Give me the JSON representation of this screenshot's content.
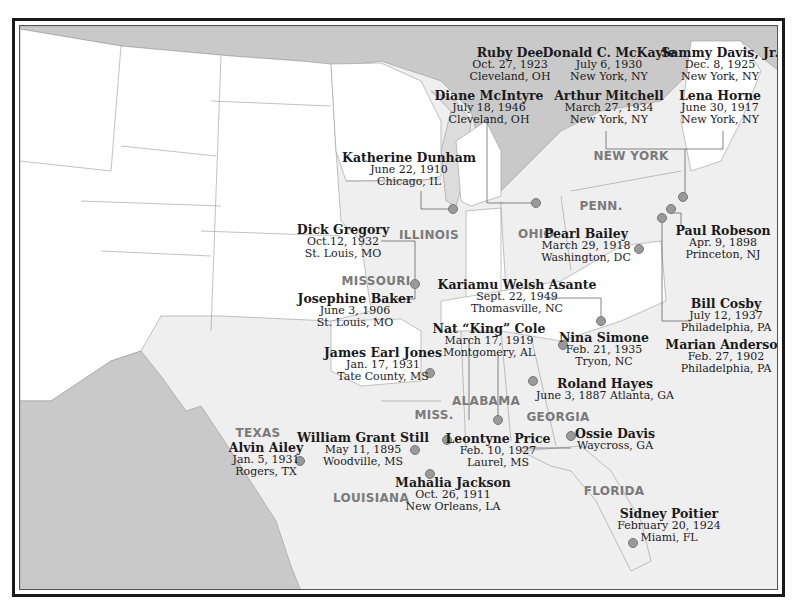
{
  "map": {
    "colors": {
      "land_us": "#efefef",
      "land_other": "#c9c9c9",
      "water": "#c9c9c9",
      "west_states": "#ffffff",
      "highlight_states": "#e6e6e6",
      "border": "#1a1a1a",
      "dot": "#9a9a9a"
    },
    "states": [
      {
        "label": "NEW YORK",
        "x": 630,
        "y": 155
      },
      {
        "label": "PENN.",
        "x": 600,
        "y": 205
      },
      {
        "label": "OHIO",
        "x": 535,
        "y": 233
      },
      {
        "label": "ILLINOIS",
        "x": 428,
        "y": 234
      },
      {
        "label": "MISSOURI",
        "x": 375,
        "y": 280
      },
      {
        "label": "ALABAMA",
        "x": 485,
        "y": 400
      },
      {
        "label": "MISS.",
        "x": 433,
        "y": 414
      },
      {
        "label": "GEORGIA",
        "x": 557,
        "y": 416
      },
      {
        "label": "TEXAS",
        "x": 257,
        "y": 432
      },
      {
        "label": "LOUISIANA",
        "x": 370,
        "y": 497
      },
      {
        "label": "FLORIDA",
        "x": 613,
        "y": 490
      }
    ],
    "people": [
      {
        "name": "Ruby Dee",
        "date": "Oct. 27, 1923",
        "place": "Cleveland, OH",
        "x": 509,
        "y": 52
      },
      {
        "name": "Diane McIntyre",
        "date": "July 18, 1946",
        "place": "Cleveland, OH",
        "x": 488,
        "y": 95
      },
      {
        "name": "Donald C. McKayle",
        "date": "July 6, 1930",
        "place": "New York, NY",
        "x": 608,
        "y": 52
      },
      {
        "name": "Arthur Mitchell",
        "date": "March 27, 1934",
        "place": "New York, NY",
        "x": 608,
        "y": 95
      },
      {
        "name": "Sammy Davis, Jr.",
        "date": "Dec. 8, 1925",
        "place": "New York, NY",
        "x": 719,
        "y": 52
      },
      {
        "name": "Lena Horne",
        "date": "June 30, 1917",
        "place": "New York, NY",
        "x": 719,
        "y": 95
      },
      {
        "name": "Katherine Dunham",
        "date": "June 22, 1910",
        "place": "Chicago, IL",
        "x": 408,
        "y": 157
      },
      {
        "name": "Dick Gregory",
        "date": "Oct.12, 1932",
        "place": "St. Louis, MO",
        "x": 342,
        "y": 229
      },
      {
        "name": "Josephine Baker",
        "date": "June 3, 1906",
        "place": "St. Louis, MO",
        "x": 354,
        "y": 298
      },
      {
        "name": "Pearl Bailey",
        "date": "March 29, 1918",
        "place": "Washington, DC",
        "x": 585,
        "y": 233
      },
      {
        "name": "Paul Robeson",
        "date": "Apr. 9, 1898",
        "place": "Princeton, NJ",
        "x": 722,
        "y": 230
      },
      {
        "name": "Kariamu Welsh Asante",
        "date": "Sept. 22, 1949",
        "place": "Thomasville, NC",
        "x": 516,
        "y": 284
      },
      {
        "name": "Bill Cosby",
        "date": "July 12, 1937",
        "place": "Philadelphia, PA",
        "x": 725,
        "y": 303
      },
      {
        "name": "Marian Anderson",
        "date": "Feb. 27, 1902",
        "place": "Philadelphia, PA",
        "x": 725,
        "y": 344
      },
      {
        "name": "Nat “King” Cole",
        "date": "March 17, 1919",
        "place": "Montgomery, AL",
        "x": 488,
        "y": 328
      },
      {
        "name": "Nina Simone",
        "date": "Feb. 21, 1935",
        "place": "Tryon, NC",
        "x": 603,
        "y": 337
      },
      {
        "name": "James Earl Jones",
        "date": "Jan. 17, 1931",
        "place": "Tate County, MS",
        "x": 382,
        "y": 352
      },
      {
        "name": "Roland Hayes",
        "date": "June 3, 1887 Atlanta, GA",
        "place": "",
        "x": 604,
        "y": 383
      },
      {
        "name": "William Grant Still",
        "date": "May 11, 1895",
        "place": "Woodville, MS",
        "x": 362,
        "y": 437
      },
      {
        "name": "Leontyne Price",
        "date": "Feb. 10, 1927",
        "place": "Laurel, MS",
        "x": 497,
        "y": 438
      },
      {
        "name": "Ossie Davis",
        "date": "Waycross, GA",
        "place": "",
        "x": 614,
        "y": 433
      },
      {
        "name": "Alvin Ailey",
        "date": "Jan. 5, 1931",
        "place": "Rogers, TX",
        "x": 265,
        "y": 447
      },
      {
        "name": "Mahalia Jackson",
        "date": "Oct. 26, 1911",
        "place": "New Orleans, LA",
        "x": 452,
        "y": 482
      },
      {
        "name": "Sidney Poitier",
        "date": "February 20, 1924",
        "place": "Miami, FL",
        "x": 668,
        "y": 513
      }
    ],
    "dots": [
      {
        "x": 452,
        "y": 208
      },
      {
        "x": 535,
        "y": 202
      },
      {
        "x": 414,
        "y": 283
      },
      {
        "x": 638,
        "y": 248
      },
      {
        "x": 682,
        "y": 196
      },
      {
        "x": 670,
        "y": 208
      },
      {
        "x": 661,
        "y": 217
      },
      {
        "x": 600,
        "y": 320
      },
      {
        "x": 562,
        "y": 344
      },
      {
        "x": 429,
        "y": 372
      },
      {
        "x": 532,
        "y": 380
      },
      {
        "x": 497,
        "y": 419
      },
      {
        "x": 446,
        "y": 439
      },
      {
        "x": 414,
        "y": 449
      },
      {
        "x": 570,
        "y": 435
      },
      {
        "x": 299,
        "y": 460
      },
      {
        "x": 429,
        "y": 473
      },
      {
        "x": 632,
        "y": 542
      }
    ]
  }
}
